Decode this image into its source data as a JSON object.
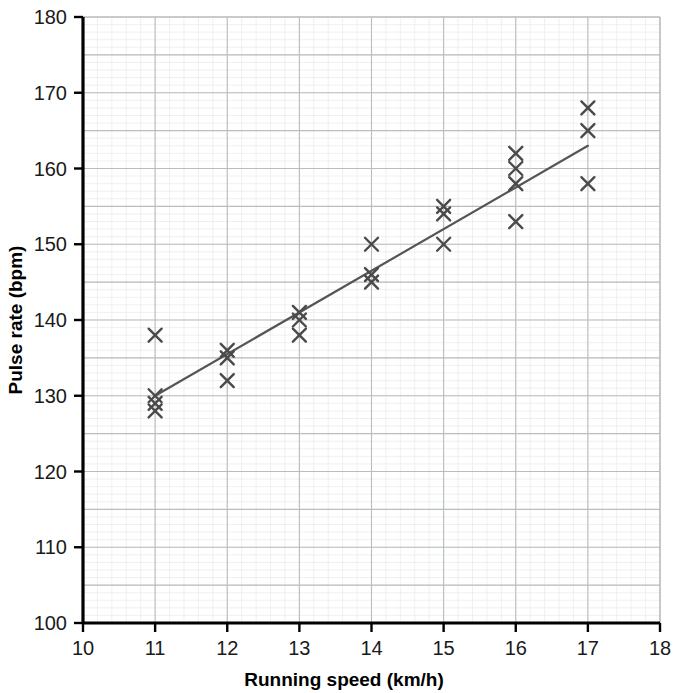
{
  "chart_data": {
    "type": "scatter",
    "title": "",
    "xlabel": "Running speed (km/h)",
    "ylabel": "Pulse rate (bpm)",
    "xlim": [
      10,
      18
    ],
    "ylim": [
      100,
      180
    ],
    "x_ticks": [
      10,
      11,
      12,
      13,
      14,
      15,
      16,
      17,
      18
    ],
    "y_ticks": [
      100,
      110,
      120,
      130,
      140,
      150,
      160,
      170,
      180
    ],
    "x_tick_labels": [
      "10",
      "11",
      "12",
      "13",
      "14",
      "15",
      "16",
      "17",
      "18"
    ],
    "y_tick_labels": [
      "100",
      "110",
      "120",
      "130",
      "140",
      "150",
      "160",
      "170",
      "180"
    ],
    "grid": {
      "major_on": true,
      "minor_on": true,
      "major_step_x": 1,
      "major_step_y": 5,
      "minor_step_x": 0.2,
      "minor_step_y": 1,
      "major_color": "#b9bcc0",
      "minor_color": "#e8e9ea"
    },
    "legend": {
      "visible": false,
      "position": "none",
      "entries": []
    },
    "marker": {
      "style": "x-cross",
      "color": "#4a4a4a",
      "size": 13,
      "stroke_width": 2.4
    },
    "points": [
      {
        "x": 11,
        "y": 138
      },
      {
        "x": 11,
        "y": 130
      },
      {
        "x": 11,
        "y": 129
      },
      {
        "x": 11,
        "y": 128
      },
      {
        "x": 12,
        "y": 136
      },
      {
        "x": 12,
        "y": 135
      },
      {
        "x": 12,
        "y": 132
      },
      {
        "x": 13,
        "y": 141
      },
      {
        "x": 13,
        "y": 140
      },
      {
        "x": 13,
        "y": 138
      },
      {
        "x": 14,
        "y": 150
      },
      {
        "x": 14,
        "y": 146
      },
      {
        "x": 14,
        "y": 145
      },
      {
        "x": 15,
        "y": 155
      },
      {
        "x": 15,
        "y": 154
      },
      {
        "x": 15,
        "y": 150
      },
      {
        "x": 16,
        "y": 162
      },
      {
        "x": 16,
        "y": 160
      },
      {
        "x": 16,
        "y": 158
      },
      {
        "x": 16,
        "y": 153
      },
      {
        "x": 17,
        "y": 168
      },
      {
        "x": 17,
        "y": 165
      },
      {
        "x": 17,
        "y": 158
      }
    ],
    "trend_line": {
      "label": "line of best fit",
      "color": "#555555",
      "stroke_width": 2.2,
      "x_start": 11,
      "y_start": 130,
      "x_end": 17,
      "y_end": 163
    },
    "axis_color": "#000000",
    "background_color": "#ffffff"
  }
}
